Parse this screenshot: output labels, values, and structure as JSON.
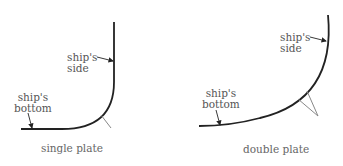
{
  "diagrams": [
    {
      "caption": "single plate",
      "labels": {
        "side_line1": "ship's",
        "side_line2": "side",
        "bottom_line1": "ship's",
        "bottom_line2": "bottom"
      }
    },
    {
      "caption": "double plate",
      "labels": {
        "side_line1": "ship's",
        "side_line2": "side",
        "bottom_line1": "ship's",
        "bottom_line2": "bottom"
      }
    }
  ],
  "colors": {
    "line": "#222222",
    "bracket": "#777777",
    "text": "#555555"
  }
}
